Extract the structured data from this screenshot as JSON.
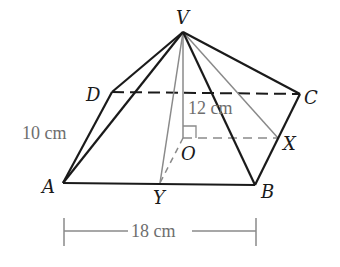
{
  "diagram": {
    "type": "rectangular-based pyramid",
    "vertices": {
      "V": {
        "label": "V",
        "x": 183,
        "y": 32
      },
      "A": {
        "label": "A",
        "x": 63,
        "y": 183
      },
      "B": {
        "label": "B",
        "x": 255,
        "y": 185
      },
      "C": {
        "label": "C",
        "x": 300,
        "y": 94
      },
      "D": {
        "label": "D",
        "x": 112,
        "y": 92
      },
      "O": {
        "label": "O",
        "x": 183,
        "y": 138
      },
      "X": {
        "label": "X",
        "x": 278,
        "y": 138
      },
      "Y": {
        "label": "Y",
        "x": 160,
        "y": 183
      }
    },
    "labels": {
      "V": "V",
      "A": "A",
      "B": "B",
      "C": "C",
      "D": "D",
      "O": "O",
      "X": "X",
      "Y": "Y"
    },
    "measurements": {
      "height": "12 cm",
      "width": "10 cm",
      "length": "18 cm"
    },
    "colors": {
      "edge": "#1a1a1a",
      "construction": "#8a8a8a",
      "dimension_text": "#6e6e6e"
    }
  }
}
